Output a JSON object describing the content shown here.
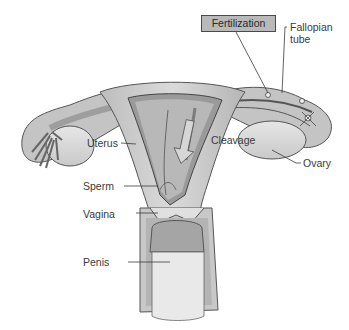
{
  "figure": {
    "title_label": "Fertilization",
    "labels": {
      "fallopian_tube_line1": "Fallopian",
      "fallopian_tube_line2": "tube",
      "uterus": "Uterus",
      "cleavage": "Cleavage",
      "ovary": "Ovary",
      "sperm": "Sperm",
      "vagina": "Vagina",
      "penis": "Penis"
    },
    "colors": {
      "tissue_light": "#d4d4d4",
      "tissue_mid": "#a9a9a9",
      "tissue_dark": "#7a7a7a",
      "outline": "#4a4a4a",
      "label_box": "#b9b9b9",
      "background": "#ffffff"
    }
  }
}
